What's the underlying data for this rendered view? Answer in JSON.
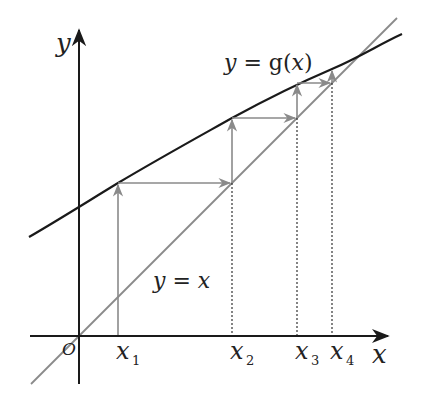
{
  "diagram": {
    "axes": {
      "x_label": "x",
      "y_label": "y",
      "origin_label": "O"
    },
    "curves": [
      {
        "name": "g",
        "label_prefix": "y = ",
        "label_fn": "g",
        "label_arg": "(x)",
        "label": "y = g(x)",
        "color": "#1a1a1a"
      },
      {
        "name": "identity",
        "label_lhs": "y",
        "label_eq": " = ",
        "label_rhs": "x",
        "label": "y = x",
        "color": "#8a8a8a"
      }
    ],
    "iterates": [
      {
        "base": "x",
        "sub": "1"
      },
      {
        "base": "x",
        "sub": "2"
      },
      {
        "base": "x",
        "sub": "3"
      },
      {
        "base": "x",
        "sub": "4"
      }
    ],
    "colors": {
      "axis": "#1a1a1a",
      "curve_g": "#1a1a1a",
      "line_identity": "#8a8a8a",
      "arrows": "#8a8a8a",
      "dotted": "#333333"
    }
  }
}
